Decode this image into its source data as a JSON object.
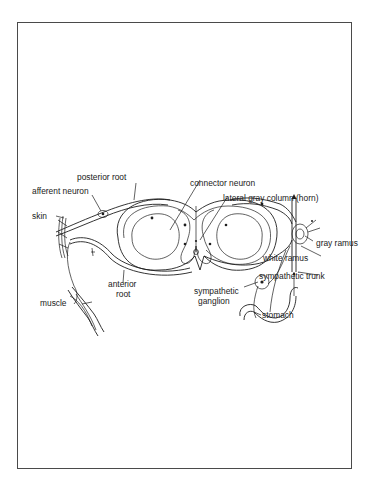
{
  "figure": {
    "frame_color": "#4a4a4a",
    "ink_color": "#1e1e1e",
    "labels": {
      "posterior_root": "posterior root",
      "afferent_neuron": "afferent neuron",
      "skin": "skin",
      "connector_neuron": "connector neuron",
      "lateral_gray_column": "lateral gray column (horn)",
      "gray_ramus": "gray ramus",
      "white_ramus": "white ramus",
      "sympathetic_trunk": "sympathetic trunk",
      "anterior_root_line1": "anterior",
      "anterior_root_line2": "root",
      "muscle": "muscle",
      "sympathetic_ganglion_line1": "sympathetic",
      "sympathetic_ganglion_line2": "ganglion",
      "stomach": "stomach"
    }
  }
}
